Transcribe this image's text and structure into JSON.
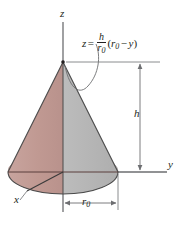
{
  "figure": {
    "kind": "cone-volume-diagram",
    "background_color": "#ffffff",
    "axes": {
      "z_label": "z",
      "y_label": "y",
      "x_label": "x",
      "axis_color": "#6d6e71"
    },
    "dimensions": {
      "height_label": "h",
      "radius_label": "r",
      "radius_subscript": "0"
    },
    "equation": {
      "lhs": "z",
      "equals": "=",
      "numerator": "h",
      "denominator": "r",
      "denominator_subscript": "0",
      "open_paren": "(",
      "term1": "r",
      "term1_subscript": "0",
      "minus": "−",
      "term2": "y",
      "close_paren": ")",
      "plain_text": "z = h/r0 (r0 − y)"
    },
    "colors": {
      "cone_left_fill": "#c49d97",
      "cone_right_fill": "#b6b6b6",
      "base_left_fill": "#c49d97",
      "base_right_fill": "#b6b6b6",
      "outline": "#3d3d3d",
      "axis": "#6d6e71",
      "text": "#231f20",
      "dimension_line": "#6d6e71"
    },
    "geometry": {
      "apex_x": 63,
      "apex_y": 62,
      "base_center_x": 63,
      "base_center_y": 172,
      "base_rx": 55,
      "base_ry": 22,
      "height_px": 110
    }
  }
}
